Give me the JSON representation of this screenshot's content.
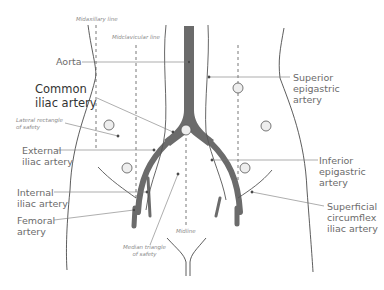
{
  "colors": {
    "artery": "#6b6b6b",
    "outline": "#333333",
    "guide_line": "#777777",
    "label_text": "#6b6b6b",
    "marker_fill": "#eeeeee",
    "background": "#ffffff"
  },
  "reference_lines": {
    "midaxillary": "Midaxillary line",
    "midclavicular": "Midclavicular line",
    "midline": "Midline"
  },
  "zones": {
    "lateral": "Lateral rectangle\nof safety",
    "median": "Median triangle\nof safety"
  },
  "labels": {
    "aorta": "Aorta",
    "common_iliac": "Common\niliac artery",
    "external_iliac": "External\niliac artery",
    "internal_iliac": "Internal\niliac artery",
    "femoral": "Femoral\nartery",
    "superior_epigastric": "Superior\nepigastric\nartery",
    "inferior_epigastric": "Inferior\nepigastric\nartery",
    "superficial_circumflex": "Superficial\ncircumflex\niliac artery"
  },
  "port_markers": [
    "umbilical",
    "left-upper",
    "right-upper",
    "left-lateral",
    "right-lateral",
    "left-lower",
    "right-lower"
  ]
}
